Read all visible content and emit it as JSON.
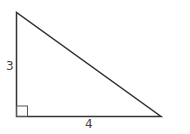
{
  "diagram": {
    "type": "right-triangle",
    "labels": {
      "vertical_leg": "3",
      "horizontal_leg": "4"
    },
    "right_angle_marker": true,
    "colors": {
      "stroke": "#333333",
      "text": "#444444",
      "background": "#ffffff"
    }
  }
}
